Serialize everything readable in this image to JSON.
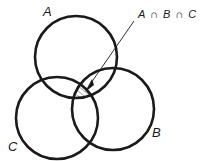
{
  "diagram": {
    "type": "venn",
    "sets": [
      {
        "id": "A",
        "label": "A",
        "cx": 76,
        "cy": 57,
        "r": 41
      },
      {
        "id": "B",
        "label": "B",
        "cx": 113,
        "cy": 109,
        "r": 41
      },
      {
        "id": "C",
        "label": "C",
        "cx": 57,
        "cy": 118,
        "r": 41
      }
    ],
    "annotation": {
      "label": "A ∩ B ∩ C",
      "target": "intersection of A, B and C"
    },
    "colors": {
      "stroke": "#1a1a1a",
      "background": "#ffffff"
    }
  }
}
